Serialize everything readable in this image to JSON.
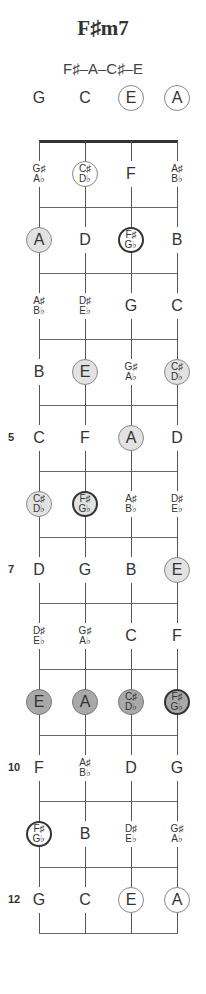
{
  "chord": {
    "name": "F♯m7",
    "notes_text": "F♯–A–C♯–E"
  },
  "layout": {
    "strings_x": [
      39,
      85,
      131,
      177
    ],
    "nut_y": 141,
    "fret_spacing": 66,
    "open_row_y": 98,
    "frets": 12
  },
  "colors": {
    "light_fill": "#e2e2e2",
    "dark_fill": "#a9a9a9",
    "root_border": "#333333",
    "line": "#666666"
  },
  "fret_labels": [
    {
      "fret": 5,
      "label": "5"
    },
    {
      "fret": 7,
      "label": "7"
    },
    {
      "fret": 10,
      "label": "10"
    },
    {
      "fret": 12,
      "label": "12"
    }
  ],
  "rows": [
    {
      "fret": 0,
      "cells": [
        {
          "top": "G",
          "style": "none"
        },
        {
          "top": "C",
          "style": "none"
        },
        {
          "top": "E",
          "style": "outline"
        },
        {
          "top": "A",
          "style": "outline"
        }
      ]
    },
    {
      "fret": 1,
      "cells": [
        {
          "top": "G♯",
          "bottom": "A♭",
          "style": "none"
        },
        {
          "top": "C♯",
          "bottom": "D♭",
          "style": "outline"
        },
        {
          "top": "F",
          "style": "none"
        },
        {
          "top": "A♯",
          "bottom": "B♭",
          "style": "none"
        }
      ]
    },
    {
      "fret": 2,
      "cells": [
        {
          "top": "A",
          "style": "light"
        },
        {
          "top": "D",
          "style": "none"
        },
        {
          "top": "F♯",
          "bottom": "G♭",
          "style": "outline root"
        },
        {
          "top": "B",
          "style": "none"
        }
      ]
    },
    {
      "fret": 3,
      "cells": [
        {
          "top": "A♯",
          "bottom": "B♭",
          "style": "none"
        },
        {
          "top": "D♯",
          "bottom": "E♭",
          "style": "none"
        },
        {
          "top": "G",
          "style": "none"
        },
        {
          "top": "C",
          "style": "none"
        }
      ]
    },
    {
      "fret": 4,
      "cells": [
        {
          "top": "B",
          "style": "none"
        },
        {
          "top": "E",
          "style": "light"
        },
        {
          "top": "G♯",
          "bottom": "A♭",
          "style": "none"
        },
        {
          "top": "C♯",
          "bottom": "D♭",
          "style": "light"
        }
      ]
    },
    {
      "fret": 5,
      "cells": [
        {
          "top": "C",
          "style": "none"
        },
        {
          "top": "F",
          "style": "none"
        },
        {
          "top": "A",
          "style": "light"
        },
        {
          "top": "D",
          "style": "none"
        }
      ]
    },
    {
      "fret": 6,
      "cells": [
        {
          "top": "C♯",
          "bottom": "D♭",
          "style": "light"
        },
        {
          "top": "F♯",
          "bottom": "G♭",
          "style": "light root"
        },
        {
          "top": "A♯",
          "bottom": "B♭",
          "style": "none"
        },
        {
          "top": "D♯",
          "bottom": "E♭",
          "style": "none"
        }
      ]
    },
    {
      "fret": 7,
      "cells": [
        {
          "top": "D",
          "style": "none"
        },
        {
          "top": "G",
          "style": "none"
        },
        {
          "top": "B",
          "style": "none"
        },
        {
          "top": "E",
          "style": "light"
        }
      ]
    },
    {
      "fret": 8,
      "cells": [
        {
          "top": "D♯",
          "bottom": "E♭",
          "style": "none"
        },
        {
          "top": "G♯",
          "bottom": "A♭",
          "style": "none"
        },
        {
          "top": "C",
          "style": "none"
        },
        {
          "top": "F",
          "style": "none"
        }
      ]
    },
    {
      "fret": 9,
      "cells": [
        {
          "top": "E",
          "style": "dark"
        },
        {
          "top": "A",
          "style": "dark"
        },
        {
          "top": "C♯",
          "bottom": "D♭",
          "style": "dark"
        },
        {
          "top": "F♯",
          "bottom": "G♭",
          "style": "dark root"
        }
      ]
    },
    {
      "fret": 10,
      "cells": [
        {
          "top": "F",
          "style": "none"
        },
        {
          "top": "A♯",
          "bottom": "B♭",
          "style": "none"
        },
        {
          "top": "D",
          "style": "none"
        },
        {
          "top": "G",
          "style": "none"
        }
      ]
    },
    {
      "fret": 11,
      "cells": [
        {
          "top": "F♯",
          "bottom": "G♭",
          "style": "outline root"
        },
        {
          "top": "B",
          "style": "none"
        },
        {
          "top": "D♯",
          "bottom": "E♭",
          "style": "none"
        },
        {
          "top": "G♯",
          "bottom": "A♭",
          "style": "none"
        }
      ]
    },
    {
      "fret": 12,
      "cells": [
        {
          "top": "G",
          "style": "none"
        },
        {
          "top": "C",
          "style": "none"
        },
        {
          "top": "E",
          "style": "outline"
        },
        {
          "top": "A",
          "style": "outline"
        }
      ]
    }
  ]
}
